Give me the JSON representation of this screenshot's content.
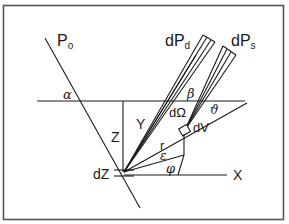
{
  "diagram": {
    "type": "geometry-schematic",
    "colors": {
      "line": "#1a1a1a",
      "frame": "#555555",
      "background": "#ffffff"
    },
    "labels": {
      "Po": "P",
      "Po_sub": "o",
      "dPd": "dP",
      "dPd_sub": "d",
      "dPs": "dP",
      "dPs_sub": "s",
      "alpha": "α",
      "beta": "β",
      "theta": "ϑ",
      "dOmega": "dΩ",
      "dV": "dV",
      "Z": "Z",
      "Y": "Y",
      "r": "r",
      "epsilon": "ε",
      "phi": "φ",
      "dZ": "dZ",
      "X": "X"
    }
  }
}
